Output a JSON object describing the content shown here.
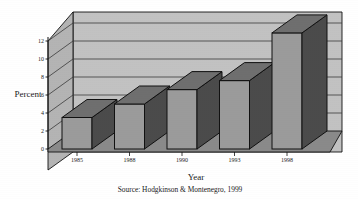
{
  "chart_data": {
    "type": "bar",
    "title": "",
    "categories": [
      "1985",
      "1988",
      "1990",
      "1993",
      "1998"
    ],
    "values": [
      3.5,
      5.0,
      6.6,
      7.6,
      12.9
    ],
    "xlabel": "Year",
    "ylabel": "Percent",
    "ylim": [
      0,
      13.5
    ],
    "yticks": [
      0,
      2,
      4,
      6,
      8,
      10,
      12
    ],
    "ytick_labels": [
      "0",
      "2",
      "4",
      "6",
      "8",
      "10",
      "12"
    ],
    "grid": true,
    "legend": "none",
    "style": "3d-perspective-bars",
    "annotations": [
      "Source: Hodgkinson & Montenegro, 1999"
    ],
    "source_note": "Source: Hodgkinson & Montenegro, 1999"
  },
  "colors": {
    "bar_front": "#9b9b9b",
    "bar_side": "#4b4b4b",
    "bar_top": "#6f6f6f",
    "wall_back": "#c2c2c2",
    "wall_left": "#b4b4b4",
    "floor": "#8a8a8a",
    "outline": "#111111",
    "gridline": "#3a3a3a",
    "text": "#1a1a1a",
    "background": "#ffffff"
  },
  "labels": {
    "y_axis_title": "Percent",
    "x_axis_title": "Year",
    "source": "Source: Hodgkinson & Montenegro, 1999"
  }
}
